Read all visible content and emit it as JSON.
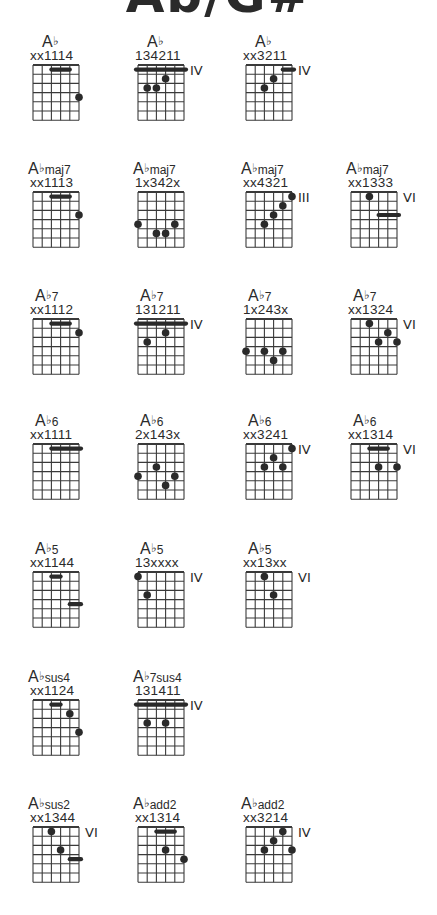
{
  "title": "Ab/G#",
  "layout": {
    "columns_x": [
      33,
      138,
      246,
      351
    ],
    "rows_y": [
      33,
      160,
      287,
      412,
      540,
      668,
      795
    ],
    "string_gap": 9.2,
    "fret_gap": 9.2,
    "frets_shown": 6
  },
  "colors": {
    "ink": "#2a2a2a",
    "grid": "#3a3a3a",
    "background": "#ffffff"
  },
  "sections": [
    {
      "label": "Ab",
      "chords": [
        {
          "root": "A",
          "acc": "b",
          "qual": "",
          "fingering": "xx1114",
          "position": "",
          "col": 0,
          "row": 0,
          "barres": [
            {
              "fret": 1,
              "from": 3,
              "to": 5
            }
          ],
          "dots": [
            {
              "string": 6,
              "fret": 4
            }
          ]
        },
        {
          "root": "A",
          "acc": "b",
          "qual": "",
          "fingering": "134211",
          "position": "IV",
          "col": 1,
          "row": 0,
          "barres": [
            {
              "fret": 1,
              "from": 1,
              "to": 6
            }
          ],
          "dots": [
            {
              "string": 4,
              "fret": 2
            },
            {
              "string": 2,
              "fret": 3
            },
            {
              "string": 3,
              "fret": 3
            }
          ]
        },
        {
          "root": "A",
          "acc": "b",
          "qual": "",
          "fingering": "xx3211",
          "position": "IV",
          "col": 2,
          "row": 0,
          "barres": [
            {
              "fret": 1,
              "from": 5,
              "to": 6
            }
          ],
          "dots": [
            {
              "string": 4,
              "fret": 2
            },
            {
              "string": 3,
              "fret": 3
            }
          ]
        }
      ]
    },
    {
      "label": "Abmaj7",
      "chords": [
        {
          "root": "A",
          "acc": "b",
          "qual": "maj7",
          "fingering": "xx1113",
          "position": "",
          "col": 0,
          "row": 1,
          "barres": [
            {
              "fret": 1,
              "from": 3,
              "to": 5
            }
          ],
          "dots": [
            {
              "string": 6,
              "fret": 3
            }
          ]
        },
        {
          "root": "A",
          "acc": "b",
          "qual": "maj7",
          "fingering": "1x342x",
          "position": "",
          "col": 1,
          "row": 1,
          "barres": [],
          "dots": [
            {
              "string": 1,
              "fret": 4
            },
            {
              "string": 5,
              "fret": 4
            },
            {
              "string": 3,
              "fret": 5
            },
            {
              "string": 4,
              "fret": 5
            }
          ]
        },
        {
          "root": "A",
          "acc": "b",
          "qual": "maj7",
          "fingering": "xx4321",
          "position": "III",
          "col": 2,
          "row": 1,
          "barres": [],
          "dots": [
            {
              "string": 6,
              "fret": 1
            },
            {
              "string": 5,
              "fret": 2
            },
            {
              "string": 4,
              "fret": 3
            },
            {
              "string": 3,
              "fret": 4
            }
          ]
        },
        {
          "root": "A",
          "acc": "b",
          "qual": "maj7",
          "fingering": "xx1333",
          "position": "VI",
          "col": 3,
          "row": 1,
          "barres": [
            {
              "fret": 3,
              "from": 4,
              "to": 6
            }
          ],
          "dots": [
            {
              "string": 3,
              "fret": 1
            }
          ]
        }
      ]
    },
    {
      "label": "Ab7",
      "chords": [
        {
          "root": "A",
          "acc": "b",
          "qual": "7",
          "fingering": "xx1112",
          "position": "",
          "col": 0,
          "row": 2,
          "barres": [
            {
              "fret": 1,
              "from": 3,
              "to": 5
            }
          ],
          "dots": [
            {
              "string": 6,
              "fret": 2
            }
          ]
        },
        {
          "root": "A",
          "acc": "b",
          "qual": "7",
          "fingering": "131211",
          "position": "IV",
          "col": 1,
          "row": 2,
          "barres": [
            {
              "fret": 1,
              "from": 1,
              "to": 6
            }
          ],
          "dots": [
            {
              "string": 4,
              "fret": 2
            },
            {
              "string": 2,
              "fret": 3
            }
          ]
        },
        {
          "root": "A",
          "acc": "b",
          "qual": "7",
          "fingering": "1x243x",
          "position": "",
          "col": 2,
          "row": 2,
          "barres": [],
          "dots": [
            {
              "string": 1,
              "fret": 4
            },
            {
              "string": 3,
              "fret": 4
            },
            {
              "string": 5,
              "fret": 4
            },
            {
              "string": 4,
              "fret": 5
            }
          ]
        },
        {
          "root": "A",
          "acc": "b",
          "qual": "7",
          "fingering": "xx1324",
          "position": "VI",
          "col": 3,
          "row": 2,
          "barres": [],
          "dots": [
            {
              "string": 3,
              "fret": 1
            },
            {
              "string": 5,
              "fret": 2
            },
            {
              "string": 4,
              "fret": 3
            },
            {
              "string": 6,
              "fret": 3
            }
          ]
        }
      ]
    },
    {
      "label": "Ab6",
      "chords": [
        {
          "root": "A",
          "acc": "b",
          "qual": "6",
          "fingering": "xx1111",
          "position": "",
          "col": 0,
          "row": 3,
          "barres": [
            {
              "fret": 1,
              "from": 3,
              "to": 6
            }
          ],
          "dots": []
        },
        {
          "root": "A",
          "acc": "b",
          "qual": "6",
          "fingering": "2x143x",
          "position": "",
          "col": 1,
          "row": 3,
          "barres": [],
          "dots": [
            {
              "string": 3,
              "fret": 3
            },
            {
              "string": 1,
              "fret": 4
            },
            {
              "string": 5,
              "fret": 4
            },
            {
              "string": 4,
              "fret": 5
            }
          ]
        },
        {
          "root": "A",
          "acc": "b",
          "qual": "6",
          "fingering": "xx3241",
          "position": "IV",
          "col": 2,
          "row": 3,
          "barres": [],
          "dots": [
            {
              "string": 6,
              "fret": 1
            },
            {
              "string": 4,
              "fret": 2
            },
            {
              "string": 3,
              "fret": 3
            },
            {
              "string": 5,
              "fret": 3
            }
          ]
        },
        {
          "root": "A",
          "acc": "b",
          "qual": "6",
          "fingering": "xx1314",
          "position": "VI",
          "col": 3,
          "row": 3,
          "barres": [
            {
              "fret": 1,
              "from": 3,
              "to": 5
            }
          ],
          "dots": [
            {
              "string": 4,
              "fret": 3
            },
            {
              "string": 6,
              "fret": 3
            }
          ]
        }
      ]
    },
    {
      "label": "Ab5",
      "chords": [
        {
          "root": "A",
          "acc": "b",
          "qual": "5",
          "fingering": "xx1144",
          "position": "",
          "col": 0,
          "row": 4,
          "barres": [
            {
              "fret": 1,
              "from": 3,
              "to": 4
            },
            {
              "fret": 4,
              "from": 5,
              "to": 6
            }
          ],
          "dots": []
        },
        {
          "root": "A",
          "acc": "b",
          "qual": "5",
          "fingering": "13xxxx",
          "position": "IV",
          "col": 1,
          "row": 4,
          "barres": [],
          "dots": [
            {
              "string": 1,
              "fret": 1
            },
            {
              "string": 2,
              "fret": 3
            }
          ]
        },
        {
          "root": "A",
          "acc": "b",
          "qual": "5",
          "fingering": "xx13xx",
          "position": "VI",
          "col": 2,
          "row": 4,
          "barres": [],
          "dots": [
            {
              "string": 3,
              "fret": 1
            },
            {
              "string": 4,
              "fret": 3
            }
          ]
        }
      ]
    },
    {
      "label": "Absus4",
      "chords": [
        {
          "root": "A",
          "acc": "b",
          "qual": "sus4",
          "fingering": "xx1124",
          "position": "",
          "col": 0,
          "row": 5,
          "barres": [
            {
              "fret": 1,
              "from": 3,
              "to": 4
            }
          ],
          "dots": [
            {
              "string": 5,
              "fret": 2
            },
            {
              "string": 6,
              "fret": 4
            }
          ]
        },
        {
          "root": "A",
          "acc": "b",
          "qual": "7sus4",
          "fingering": "131411",
          "position": "IV",
          "col": 1,
          "row": 5,
          "barres": [
            {
              "fret": 1,
              "from": 1,
              "to": 6
            }
          ],
          "dots": [
            {
              "string": 2,
              "fret": 3
            },
            {
              "string": 4,
              "fret": 3
            }
          ]
        }
      ]
    },
    {
      "label": "Absus2 / Abadd2",
      "chords": [
        {
          "root": "A",
          "acc": "b",
          "qual": "sus2",
          "fingering": "xx1344",
          "position": "VI",
          "col": 0,
          "row": 6,
          "barres": [
            {
              "fret": 4,
              "from": 5,
              "to": 6
            }
          ],
          "dots": [
            {
              "string": 3,
              "fret": 1
            },
            {
              "string": 4,
              "fret": 3
            }
          ]
        },
        {
          "root": "A",
          "acc": "b",
          "qual": "add2",
          "fingering": "xx1314",
          "position": "",
          "col": 1,
          "row": 6,
          "barres": [
            {
              "fret": 1,
              "from": 3,
              "to": 5
            }
          ],
          "dots": [
            {
              "string": 4,
              "fret": 3
            },
            {
              "string": 6,
              "fret": 4
            }
          ]
        },
        {
          "root": "A",
          "acc": "b",
          "qual": "add2",
          "fingering": "xx3214",
          "position": "IV",
          "col": 2,
          "row": 6,
          "barres": [],
          "dots": [
            {
              "string": 5,
              "fret": 1
            },
            {
              "string": 4,
              "fret": 2
            },
            {
              "string": 3,
              "fret": 3
            },
            {
              "string": 6,
              "fret": 3
            }
          ]
        }
      ]
    }
  ]
}
